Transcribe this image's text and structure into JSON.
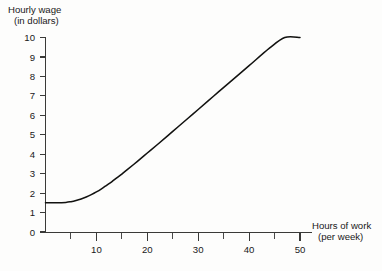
{
  "chart_data": {
    "type": "line",
    "title": "",
    "ylabel": "Hourly wage (in dollars)",
    "ylabel_line1": "Hourly wage",
    "ylabel_line2": "(in dollars)",
    "xlabel": "Hours of work (per week)",
    "xlabel_line1": "Hours of work",
    "xlabel_line2": "(per week)",
    "xlim": [
      0,
      52
    ],
    "ylim": [
      0,
      10
    ],
    "grid": false,
    "legend": "none",
    "x_ticks_major": [
      10,
      20,
      30,
      40,
      50
    ],
    "x_tick_labels": [
      "10",
      "20",
      "30",
      "40",
      "50"
    ],
    "x_ticks_minor": [
      5,
      15,
      25,
      35,
      45
    ],
    "y_ticks_major": [
      0,
      1,
      2,
      3,
      4,
      5,
      6,
      7,
      8,
      9,
      10
    ],
    "y_tick_labels": [
      "0",
      "1",
      "2",
      "3",
      "4",
      "5",
      "6",
      "7",
      "8",
      "9",
      "10"
    ],
    "series": [
      {
        "name": "Hourly wage schedule",
        "color": "#121210",
        "x": [
          0,
          2,
          4,
          5,
          6,
          7,
          8,
          9,
          10,
          11,
          12,
          13,
          14,
          15,
          16,
          18,
          20,
          22,
          25,
          28,
          30,
          33,
          36,
          40,
          44,
          47,
          50
        ],
        "y": [
          1.5,
          1.5,
          1.52,
          1.56,
          1.62,
          1.7,
          1.8,
          1.92,
          2.06,
          2.22,
          2.4,
          2.58,
          2.78,
          2.98,
          3.19,
          3.62,
          4.06,
          4.5,
          5.17,
          5.85,
          6.3,
          6.98,
          7.65,
          8.55,
          9.45,
          10.0,
          10.0
        ]
      }
    ]
  },
  "axes": {
    "y_axis_name": "wage-axis",
    "x_axis_name": "hours-axis"
  }
}
